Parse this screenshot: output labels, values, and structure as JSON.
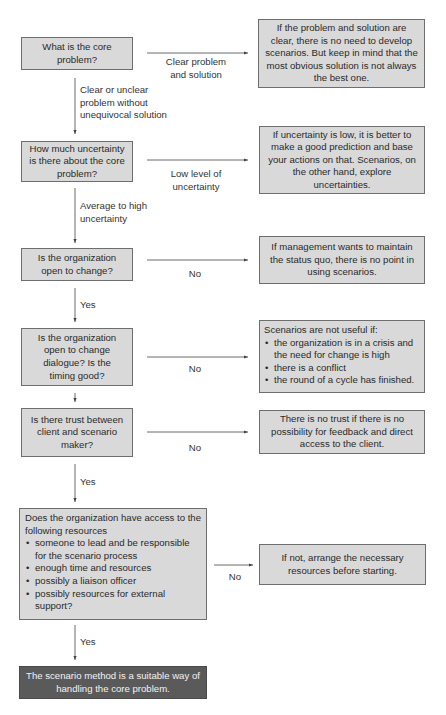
{
  "flowchart": {
    "questions": [
      {
        "id": "q1",
        "text": "What is the core problem?"
      },
      {
        "id": "q2",
        "text": "How much uncertainty is there about the core problem?"
      },
      {
        "id": "q3",
        "text": "Is the organization open to change?"
      },
      {
        "id": "q4",
        "text": "Is the organization open to change dialogue? Is the timing good?"
      },
      {
        "id": "q5",
        "text": "Is there trust between client and scenario maker?"
      },
      {
        "id": "q6",
        "intro": "Does the organization have access to the following resources",
        "items": [
          "someone to lead and be responsible for the scenario process",
          "enough time and resources",
          "possibly a liaison officer",
          "possibly resources for external support?"
        ]
      }
    ],
    "outcomes": [
      {
        "id": "r1",
        "text": "If the problem and solution are clear, there is no need to develop scenarios. But keep in mind that the most obvious solution is not always the best one."
      },
      {
        "id": "r2",
        "text": "If uncertainty is low, it is better to make a good prediction and base your actions on that. Scenarios, on the other hand, explore uncertainties."
      },
      {
        "id": "r3",
        "text": "If management wants to maintain the status quo, there is no point in using scenarios."
      },
      {
        "id": "r4",
        "intro": "Scenarios are not useful if:",
        "items": [
          "the organization is in a crisis and the need for change is high",
          "there is a conflict",
          "the round of a cycle has finished."
        ]
      },
      {
        "id": "r5",
        "text": "There is no trust if there is no possibility for feedback and direct access to the client."
      },
      {
        "id": "r6",
        "text": "If not, arrange the necessary resources before starting."
      }
    ],
    "final": {
      "text": "The scenario method is a suitable way of handling the core problem."
    },
    "edge_labels": {
      "q1_right": "Clear problem and solution",
      "q1_down": "Clear or unclear problem without unequivocal solution",
      "q2_right": "Low level of uncertainty",
      "q2_down": "Average to high uncertainty",
      "q3_right": "No",
      "q3_down": "Yes",
      "q4_right": "No",
      "q5_right": "No",
      "q5_down": "Yes",
      "q6_right": "No",
      "q6_down": "Yes"
    },
    "colors": {
      "box_fill": "#d9d9d9",
      "box_border": "#6e6e6e",
      "final_fill": "#5a5a5a",
      "final_text": "#f2f2f2",
      "line": "#444444"
    }
  }
}
